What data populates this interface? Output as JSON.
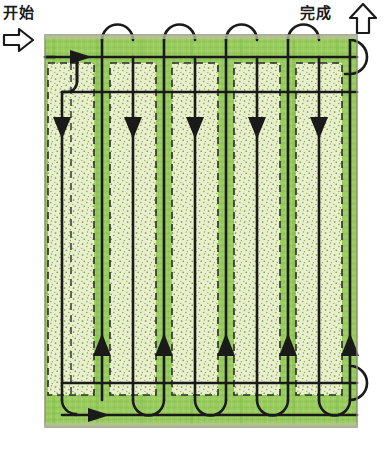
{
  "labels": {
    "start": "开始",
    "finish": "完成"
  },
  "icons": {
    "start_arrow": "arrow-right-outline-icon",
    "finish_arrow": "arrow-up-outline-icon"
  },
  "colors": {
    "grass_dark": "#8cc152",
    "grass_mid": "#9ccc5e",
    "grass_light": "#e9f0cf",
    "stipple": "#6f8f3a",
    "path_line": "#1a1a1a",
    "dashed_line": "#2b2b2b",
    "border": "#7a7a6a",
    "label_text": "#1a1a1a"
  },
  "diagram": {
    "title_hidden": "mowing-pattern-field",
    "field": {
      "x": 45,
      "y": 35,
      "width": 312,
      "height": 392
    },
    "strip_count": 5,
    "strip_pitch": 62,
    "strip_first_center": 72,
    "down_arrow_count": 5,
    "up_arrow_count": 5,
    "down_arrow_y": 128,
    "up_arrow_y": 345,
    "top_rail_y": 57,
    "second_rail_y": 92,
    "bottom_rail_y": 383,
    "lower_rail_y": 415,
    "direction_down": "down",
    "direction_up": "up",
    "entry_arrow_x": 88,
    "entry_arrow_y": 57,
    "exit_arrow_x": 105,
    "exit_arrow_y": 415
  }
}
